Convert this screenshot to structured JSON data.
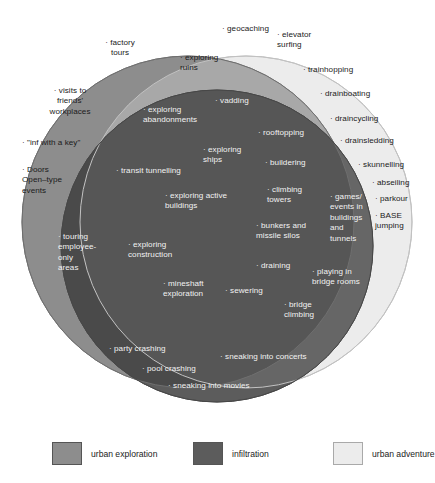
{
  "diagram": {
    "type": "venn",
    "sets": [
      {
        "id": "urban_exploration",
        "label": "urban exploration",
        "color": "#8d8d8d"
      },
      {
        "id": "infiltration",
        "label": "infiltration",
        "color": "#5c5c5c"
      },
      {
        "id": "urban_adventure",
        "label": "urban adventure",
        "color": "#ececec"
      }
    ],
    "regions": {
      "urban_exploration_only": [
        "factory tours",
        "visits to friends' workplaces",
        "\"inf with a key\"",
        "Doors Open-type events"
      ],
      "urban_exploration_and_adventure": [
        "geocaching",
        "exploring ruins"
      ],
      "urban_adventure_only": [
        "elevator surfing",
        "trainhopping",
        "drainboating",
        "draincycling",
        "drainsledding",
        "skunnelling",
        "abseiling",
        "parkour",
        "BASE jumping"
      ],
      "urban_exploration_and_infiltration": [
        "touring employee-only areas"
      ],
      "all_three": [
        "vadding",
        "exploring abandonments",
        "exploring ships",
        "transit tunnelling",
        "exploring active buildings",
        "exploring construction",
        "mineshaft exploration",
        "sewering",
        "rooftopping",
        "buildering",
        "climbing towers",
        "bunkers and missile silos",
        "draining",
        "bridge climbing"
      ],
      "infiltration_and_adventure": [
        "games/ events in buildings and tunnels",
        "playing in bridge rooms"
      ],
      "infiltration_only": [
        "party crashing",
        "pool crashing",
        "sneaking into concerts",
        "sneaking into movies"
      ]
    }
  },
  "legend": {
    "items": [
      {
        "label": "urban exploration",
        "color": "#8d8d8d"
      },
      {
        "label": "infiltration",
        "color": "#5c5c5c"
      },
      {
        "label": "urban adventure",
        "color": "#ececec"
      }
    ]
  },
  "items": {
    "factory_tours": "· factory\ntours",
    "visits_friends": "· visits to\nfriends'\nworkplaces",
    "inf_with_key": "· \"inf with a key\"",
    "doors_open": "· Doors\nOpen–type\nevents",
    "touring_employee": "· touring\nemployee-\nonly\nareas",
    "geocaching": "· geocaching",
    "exploring_ruins": "· exploring\nruins",
    "elevator_surfing": "· elevator\nsurfing",
    "trainhopping": "· trainhopping",
    "drainboating": "· drainboating",
    "draincycling": "· draincycling",
    "drainsledding": "· drainsledding",
    "skunnelling": "· skunnelling",
    "abseiling": "· abseiling",
    "parkour": "· parkour",
    "base_jumping": "· BASE\njumping",
    "vadding": "· vadding",
    "exploring_abandonments": "· exploring\nabandonments",
    "exploring_ships": "· exploring\nships",
    "transit_tunnelling": "· transit tunnelling",
    "exploring_active": "· exploring active\nbuildings",
    "exploring_construction": "· exploring\nconstruction",
    "mineshaft": "· mineshaft\nexploration",
    "sewering": "· sewering",
    "rooftopping": "· rooftopping",
    "buildering": "· buildering",
    "climbing_towers": "· climbing\ntowers",
    "bunkers": "· bunkers and\nmissile silos",
    "draining": "· draining",
    "bridge_climbing": "· bridge\nclimbing",
    "games_events": "· games/\nevents in\nbuildings\nand\ntunnels",
    "playing_bridge_rooms": "· playing in\nbridge rooms",
    "party_crashing": "· party crashing",
    "pool_crashing": "· pool crashing",
    "sneaking_concerts": "· sneaking into concerts",
    "sneaking_movies": "· sneaking into movies"
  }
}
